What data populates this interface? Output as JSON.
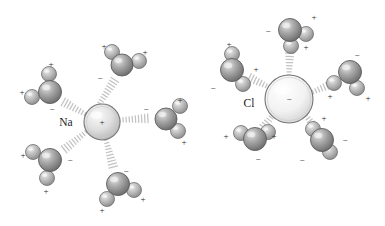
{
  "figure": {
    "background_color": "#ffffff",
    "ion_label_color": "#1d1d1d",
    "charge_symbol_color": "#2a2a2a",
    "bond_color": "#b9b9b9",
    "water_oxygen_color": "#9a9a9a",
    "water_hydrogen_color": "#b5b5b5",
    "cation_color": "#dcdcdc",
    "anion_color": "#f0f0f0",
    "plus_symbol": "+",
    "minus_symbol": "−"
  },
  "ions": [
    {
      "id": "sodium-ion",
      "label": "Na",
      "charge": "+",
      "cx": 102,
      "cy": 122,
      "r": 18,
      "fill": "#dcdcdc",
      "label_x": 66,
      "label_y": 126
    },
    {
      "id": "chloride-ion",
      "label": "Cl",
      "charge": "−",
      "cx": 289,
      "cy": 99,
      "r": 24,
      "fill": "#f1f1f1",
      "label_x": 249,
      "label_y": 107
    }
  ],
  "waters": [
    {
      "id": "na-water-top",
      "cluster": "sodium",
      "ox": 122,
      "oy": 65,
      "or": 11,
      "angle": -64,
      "h1x": 139,
      "h1y": 61,
      "h1r": 7.5,
      "h2x": 112,
      "h2y": 52,
      "h2r": 7.5,
      "charges": [
        {
          "sym": "+",
          "x": 104,
          "y": 47
        },
        {
          "sym": "+",
          "x": 145,
          "y": 53
        },
        {
          "sym": "−",
          "x": 100,
          "y": 79
        }
      ]
    },
    {
      "id": "na-water-upper-left",
      "cluster": "sodium",
      "ox": 50,
      "oy": 92,
      "or": 11.5,
      "angle": -150,
      "h1x": 32,
      "h1y": 97,
      "h1r": 7.5,
      "h2x": 49,
      "h2y": 74,
      "h2r": 7.5,
      "charges": [
        {
          "sym": "+",
          "x": 51,
          "y": 65
        },
        {
          "sym": "+",
          "x": 22,
          "y": 93
        },
        {
          "sym": "−",
          "x": 52,
          "y": 110
        }
      ]
    },
    {
      "id": "na-water-right",
      "cluster": "sodium",
      "ox": 166,
      "oy": 119,
      "or": 11,
      "angle": 10,
      "h1x": 180,
      "h1y": 106,
      "h1r": 7.5,
      "h2x": 178,
      "h2y": 131,
      "h2r": 7.5,
      "charges": [
        {
          "sym": "+",
          "x": 180,
          "y": 101
        },
        {
          "sym": "+",
          "x": 184,
          "y": 143
        },
        {
          "sym": "−",
          "x": 146,
          "y": 110
        }
      ]
    },
    {
      "id": "na-water-lower-left",
      "cluster": "sodium",
      "ox": 50,
      "oy": 160,
      "or": 11.5,
      "angle": 160,
      "h1x": 33,
      "h1y": 152,
      "h1r": 7.5,
      "h2x": 47,
      "h2y": 178,
      "h2r": 7.5,
      "charges": [
        {
          "sym": "+",
          "x": 23,
          "y": 156
        },
        {
          "sym": "+",
          "x": 46,
          "y": 192
        },
        {
          "sym": "−",
          "x": 70,
          "y": 161
        }
      ]
    },
    {
      "id": "na-water-bottom",
      "cluster": "sodium",
      "ox": 118,
      "oy": 184,
      "or": 11.5,
      "angle": 86,
      "h1x": 107,
      "h1y": 199,
      "h1r": 7.5,
      "h2x": 134,
      "h2y": 190,
      "h2r": 7.5,
      "charges": [
        {
          "sym": "+",
          "x": 102,
          "y": 211
        },
        {
          "sym": "+",
          "x": 143,
          "y": 200
        },
        {
          "sym": "−",
          "x": 126,
          "y": 172
        }
      ]
    }
  ],
  "waters_anion": [
    {
      "id": "cl-water-top",
      "cluster": "chloride",
      "ox": 290,
      "oy": 30,
      "or": 11.5,
      "angle": -90,
      "h1x": 306,
      "h1y": 34,
      "h1r": 7.5,
      "h2x": 291,
      "h2y": 46,
      "h2r": 7.5,
      "charges": [
        {
          "sym": "−",
          "x": 268,
          "y": 32
        },
        {
          "sym": "+",
          "x": 314,
          "y": 18
        },
        {
          "sym": "+",
          "x": 306,
          "y": 48
        }
      ]
    },
    {
      "id": "cl-water-upper-left",
      "cluster": "chloride",
      "ox": 232,
      "oy": 70,
      "or": 11.5,
      "angle": -152,
      "h1x": 243,
      "h1y": 84,
      "h1r": 7.5,
      "h2x": 232,
      "h2y": 54,
      "h2r": 7.5,
      "charges": [
        {
          "sym": "−",
          "x": 213,
          "y": 89
        },
        {
          "sym": "+",
          "x": 229,
          "y": 45
        },
        {
          "sym": "+",
          "x": 256,
          "y": 70
        }
      ]
    },
    {
      "id": "cl-water-right",
      "cluster": "chloride",
      "ox": 350,
      "oy": 72,
      "or": 11.5,
      "angle": 22,
      "h1x": 334,
      "h1y": 83,
      "h1r": 7.5,
      "h2x": 357,
      "h2y": 88,
      "h2r": 7.5,
      "charges": [
        {
          "sym": "−",
          "x": 357,
          "y": 56
        },
        {
          "sym": "+",
          "x": 330,
          "y": 97
        },
        {
          "sym": "+",
          "x": 368,
          "y": 99
        }
      ]
    },
    {
      "id": "cl-water-lower-left",
      "cluster": "chloride",
      "ox": 255,
      "oy": 139,
      "or": 11.5,
      "angle": 150,
      "h1x": 268,
      "h1y": 132,
      "h1r": 7.5,
      "h2x": 241,
      "h2y": 133,
      "h2r": 7.5,
      "charges": [
        {
          "sym": "+",
          "x": 226,
          "y": 137
        },
        {
          "sym": "+",
          "x": 274,
          "y": 137
        },
        {
          "sym": "−",
          "x": 258,
          "y": 160
        }
      ]
    },
    {
      "id": "cl-water-lower-right",
      "cluster": "chloride",
      "ox": 322,
      "oy": 140,
      "or": 11.5,
      "angle": 50,
      "h1x": 313,
      "h1y": 129,
      "h1r": 7.5,
      "h2x": 330,
      "h2y": 152,
      "h2r": 7.5,
      "charges": [
        {
          "sym": "+",
          "x": 324,
          "y": 119
        },
        {
          "sym": "−",
          "x": 345,
          "y": 141
        },
        {
          "sym": "−",
          "x": 302,
          "y": 161
        }
      ]
    }
  ],
  "bonds": [
    {
      "id": "bond-na-top",
      "x1": 98,
      "y1": 106,
      "x2": 116,
      "y2": 78
    },
    {
      "id": "bond-na-upper-left",
      "x1": 85,
      "y1": 114,
      "x2": 60,
      "y2": 100
    },
    {
      "id": "bond-na-right",
      "x1": 120,
      "y1": 120,
      "x2": 152,
      "y2": 118
    },
    {
      "id": "bond-na-lower-left",
      "x1": 86,
      "y1": 132,
      "x2": 61,
      "y2": 152
    },
    {
      "id": "bond-na-bottom",
      "x1": 106,
      "y1": 140,
      "x2": 114,
      "y2": 170
    },
    {
      "id": "bond-cl-top",
      "x1": 289,
      "y1": 75,
      "x2": 290,
      "y2": 46
    },
    {
      "id": "bond-cl-upper-left",
      "x1": 269,
      "y1": 87,
      "x2": 246,
      "y2": 76
    },
    {
      "id": "bond-cl-right",
      "x1": 313,
      "y1": 92,
      "x2": 336,
      "y2": 82
    },
    {
      "id": "bond-cl-lower-left",
      "x1": 273,
      "y1": 115,
      "x2": 262,
      "y2": 129
    },
    {
      "id": "bond-cl-lower-right",
      "x1": 306,
      "y1": 116,
      "x2": 316,
      "y2": 129
    }
  ]
}
